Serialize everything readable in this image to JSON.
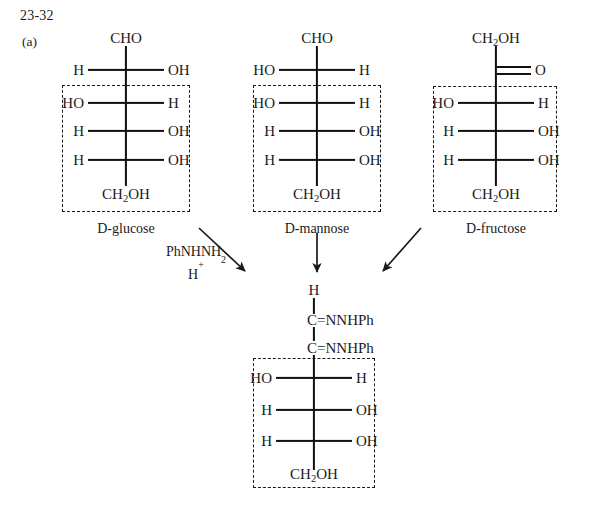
{
  "header": {
    "problem_number": "23-32",
    "part_label": "(a)"
  },
  "reagent": {
    "line1_text": "PhNHNH",
    "line1_sub": "2",
    "line2_text": "H",
    "line2_sup": "+"
  },
  "structures": [
    {
      "id": "d-glucose",
      "caption": "D-glucose",
      "top_group": "CHO",
      "bottom_group": "CH2OH",
      "bottom_group_text": "CH",
      "bottom_group_sub": "2",
      "bottom_group_tail": "OH",
      "rows": [
        {
          "left": "H",
          "right": "OH",
          "in_box": false
        },
        {
          "left": "HO",
          "right": "H",
          "in_box": true
        },
        {
          "left": "H",
          "right": "OH",
          "in_box": true
        },
        {
          "left": "H",
          "right": "OH",
          "in_box": true
        }
      ]
    },
    {
      "id": "d-mannose",
      "caption": "D-mannose",
      "top_group": "CHO",
      "bottom_group": "CH2OH",
      "bottom_group_text": "CH",
      "bottom_group_sub": "2",
      "bottom_group_tail": "OH",
      "rows": [
        {
          "left": "HO",
          "right": "H",
          "in_box": false
        },
        {
          "left": "HO",
          "right": "H",
          "in_box": true
        },
        {
          "left": "H",
          "right": "OH",
          "in_box": true
        },
        {
          "left": "H",
          "right": "OH",
          "in_box": true
        }
      ]
    },
    {
      "id": "d-fructose",
      "caption": "D-fructose",
      "top_group": "CH2OH",
      "top_group_text": "CH",
      "top_group_sub": "2",
      "top_group_tail": "OH",
      "carbonyl_group": "O",
      "bottom_group": "CH2OH",
      "bottom_group_text": "CH",
      "bottom_group_sub": "2",
      "bottom_group_tail": "OH",
      "rows": [
        {
          "left": "HO",
          "right": "H",
          "in_box": true
        },
        {
          "left": "H",
          "right": "OH",
          "in_box": true
        },
        {
          "left": "H",
          "right": "OH",
          "in_box": true
        }
      ]
    },
    {
      "id": "osazone",
      "caption": "",
      "top_group": "H",
      "hydrazone_1": "C=NNHPh",
      "hydrazone_2": "C=NNHPh",
      "bottom_group": "CH2OH",
      "bottom_group_text": "CH",
      "bottom_group_sub": "2",
      "bottom_group_tail": "OH",
      "rows": [
        {
          "left": "HO",
          "right": "H",
          "in_box": true
        },
        {
          "left": "H",
          "right": "OH",
          "in_box": true
        },
        {
          "left": "H",
          "right": "OH",
          "in_box": true
        }
      ]
    }
  ],
  "arrows": [
    {
      "id": "glucose-to-osazone",
      "direction": "down-right"
    },
    {
      "id": "mannose-to-osazone",
      "direction": "down"
    },
    {
      "id": "fructose-to-osazone",
      "direction": "down-left"
    }
  ],
  "colors": {
    "ink": "#1a1a1a",
    "background": "#ffffff",
    "bond": "#111111",
    "box_border": "#1a1a1a"
  }
}
